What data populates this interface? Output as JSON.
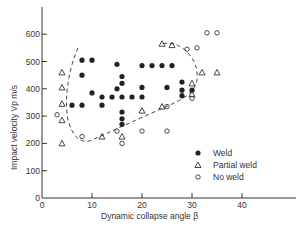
{
  "chart_data": {
    "type": "scatter",
    "title": "",
    "xlabel": "Dynamic collapse angle β",
    "ylabel": "Impact velocity Vp m/s",
    "xlim": [
      0,
      50
    ],
    "ylim": [
      0,
      700
    ],
    "x_ticks": [
      0,
      10,
      20,
      30,
      40
    ],
    "y_ticks": [
      0,
      100,
      200,
      300,
      400,
      500,
      600
    ],
    "x_tick_labels": [
      "0",
      "10",
      "20",
      "30",
      "40"
    ],
    "y_tick_labels": [
      "0",
      "100",
      "200",
      "300",
      "400",
      "500",
      "600"
    ],
    "grid": false,
    "legend_position": "lower right (inside)",
    "series": [
      {
        "name": "Weld",
        "marker": "filled-circle",
        "points": [
          [
            8,
            505
          ],
          [
            10,
            505
          ],
          [
            8,
            450
          ],
          [
            10,
            385
          ],
          [
            6,
            340
          ],
          [
            8,
            340
          ],
          [
            12,
            370
          ],
          [
            12,
            340
          ],
          [
            15,
            490
          ],
          [
            20,
            485
          ],
          [
            16,
            445
          ],
          [
            16,
            420
          ],
          [
            15,
            400
          ],
          [
            20,
            405
          ],
          [
            14,
            370
          ],
          [
            16,
            370
          ],
          [
            18,
            370
          ],
          [
            20,
            370
          ],
          [
            16,
            315
          ],
          [
            16,
            290
          ],
          [
            16,
            270
          ],
          [
            22,
            485
          ],
          [
            24,
            485
          ],
          [
            26,
            485
          ],
          [
            25,
            405
          ],
          [
            28,
            425
          ],
          [
            28,
            395
          ],
          [
            28,
            375
          ],
          [
            30,
            395
          ]
        ]
      },
      {
        "name": "Partial weld",
        "marker": "open-triangle",
        "points": [
          [
            4,
            460
          ],
          [
            4,
            405
          ],
          [
            4,
            345
          ],
          [
            4,
            285
          ],
          [
            4,
            200
          ],
          [
            12,
            225
          ],
          [
            16,
            225
          ],
          [
            20,
            320
          ],
          [
            24,
            335
          ],
          [
            24,
            565
          ],
          [
            26,
            560
          ],
          [
            32,
            460
          ],
          [
            35,
            460
          ],
          [
            30,
            420
          ],
          [
            30,
            380
          ]
        ]
      },
      {
        "name": "No weld",
        "marker": "open-circle",
        "points": [
          [
            3,
            305
          ],
          [
            8,
            225
          ],
          [
            15,
            245
          ],
          [
            16,
            200
          ],
          [
            20,
            245
          ],
          [
            25,
            245
          ],
          [
            25,
            335
          ],
          [
            30,
            365
          ],
          [
            29,
            545
          ],
          [
            31,
            550
          ],
          [
            33,
            605
          ],
          [
            35,
            605
          ]
        ]
      }
    ],
    "annotations": [
      {
        "type": "dashed-boundary",
        "description": "Dashed curve enclosing the weld region, from upper-left (~β=7, 560 m/s) down to a minimum near (~β=10, 220 m/s), rising to the right (~β=32, 400 m/s) and back up to (~β=24, 570 m/s)"
      }
    ]
  },
  "legend": {
    "items": [
      {
        "label": "Weld",
        "symbol": "●"
      },
      {
        "label": "Partial weld",
        "symbol": "△"
      },
      {
        "label": "No weld",
        "symbol": "○"
      }
    ]
  },
  "axes": {
    "x_label": "Dynamic collapse angle β",
    "y_label": "Impact velocity Vp m/s"
  }
}
